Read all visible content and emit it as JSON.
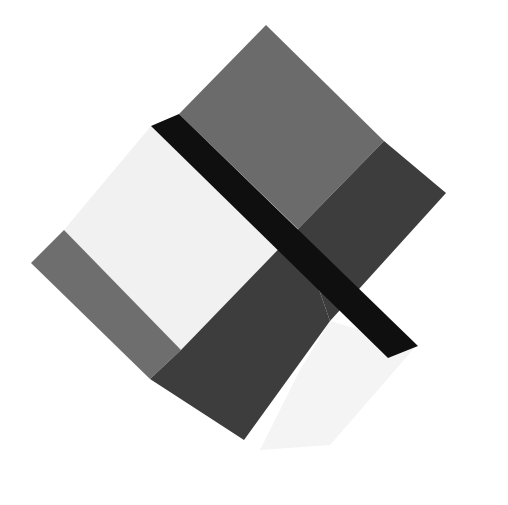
{
  "artwork": {
    "title": "Abstract geometric composition",
    "width": 508,
    "height": 505,
    "background": "#ffffff",
    "colors": {
      "medium_gray": "#6b6b6b",
      "dark_gray": "#3d3d3d",
      "black": "#0f0f0f",
      "light_panel": "#f1f1f1",
      "left_strip": "#6e6e6e",
      "bottom_light": "#f4f4f4"
    },
    "shapes": [
      {
        "name": "light-left-panel",
        "fill": "#f1f1f1",
        "points": "151,126 64,230 181,350 298,229"
      },
      {
        "name": "left-gray-strip",
        "fill": "#6e6e6e",
        "points": "64,230 31,263 150,379 181,350"
      },
      {
        "name": "top-medium-gray",
        "fill": "#6b6b6b",
        "points": "266,25 179,114 298,229 384,141"
      },
      {
        "name": "right-dark-gray",
        "fill": "#3d3d3d",
        "points": "384,141 446,193 330,321 298,229"
      },
      {
        "name": "bottom-light-square",
        "fill": "#f4f4f4",
        "points": "330,321 416,346 330,445 260,450 300,370"
      },
      {
        "name": "bottom-dark-block",
        "fill": "#3d3d3d",
        "points": "181,350 150,379 244,440 330,321 298,229"
      },
      {
        "name": "black-diagonal-bar",
        "fill": "#0f0f0f",
        "points": "179,114 151,126 388,358 418,346"
      }
    ]
  }
}
